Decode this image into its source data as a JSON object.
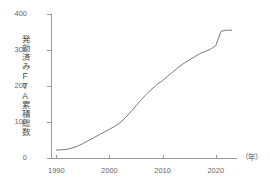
{
  "chart_data": {
    "type": "line",
    "title": "",
    "subtitle": "",
    "ylabel": "発効済みFTA累積総数",
    "xlabel": "",
    "x_unit": "（年）",
    "xlim": [
      1989,
      2024
    ],
    "ylim": [
      0,
      400
    ],
    "grid": false,
    "legend": null,
    "line_color": "#7a7a7a",
    "axis_color": "#9a9a9a",
    "text_color": "#666666",
    "y_ticks": [
      400,
      300,
      200,
      100,
      0
    ],
    "x_ticks": [
      1990,
      2000,
      2010,
      2020
    ],
    "series": [
      {
        "name": "発効済みFTA累積総数",
        "x": [
          1990,
          1991,
          1992,
          1993,
          1994,
          1995,
          1996,
          1997,
          1998,
          1999,
          2000,
          2001,
          2002,
          2003,
          2004,
          2005,
          2006,
          2007,
          2008,
          2009,
          2010,
          2011,
          2012,
          2013,
          2014,
          2015,
          2016,
          2017,
          2018,
          2019,
          2020,
          2021,
          2022,
          2023
        ],
        "values": [
          22,
          23,
          24,
          28,
          33,
          40,
          48,
          56,
          64,
          72,
          80,
          88,
          98,
          112,
          128,
          145,
          162,
          178,
          192,
          205,
          215,
          228,
          240,
          252,
          263,
          272,
          281,
          290,
          296,
          302,
          312,
          352,
          355,
          355
        ]
      }
    ],
    "annotations": [
      {
        "label": "2021年の急増",
        "x": 2021,
        "y": 352
      }
    ]
  }
}
